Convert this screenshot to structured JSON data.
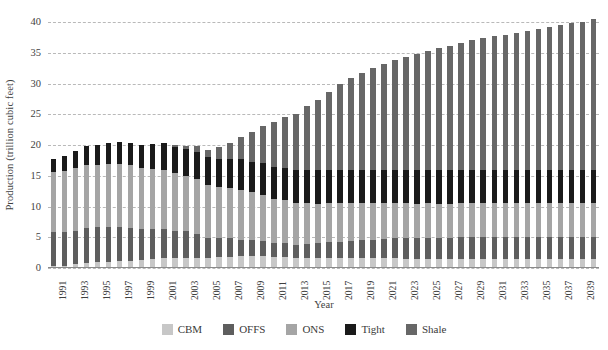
{
  "chart_data": {
    "type": "bar",
    "stacked": true,
    "title": "",
    "xlabel": "Year",
    "ylabel": "Production (trillion cubic feet)",
    "ylim": [
      0,
      40
    ],
    "yticks": [
      0,
      5,
      10,
      15,
      20,
      25,
      30,
      35,
      40
    ],
    "grid": true,
    "legend_position": "bottom",
    "tick_label_interval": 2,
    "categories": [
      "1991",
      "1992",
      "1993",
      "1994",
      "1995",
      "1996",
      "1997",
      "1998",
      "1999",
      "2000",
      "2001",
      "2002",
      "2003",
      "2004",
      "2005",
      "2006",
      "2007",
      "2008",
      "2009",
      "2010",
      "2011",
      "2012",
      "2013",
      "2014",
      "2015",
      "2016",
      "2017",
      "2018",
      "2019",
      "2020",
      "2021",
      "2022",
      "2023",
      "2024",
      "2025",
      "2026",
      "2027",
      "2028",
      "2029",
      "2030",
      "2031",
      "2032",
      "2033",
      "2034",
      "2035",
      "2036",
      "2037",
      "2038",
      "2039",
      "2040"
    ],
    "series": [
      {
        "name": "CBM",
        "color": "#c7c7c7",
        "values": [
          0.3,
          0.4,
          0.6,
          0.8,
          0.9,
          1.0,
          1.1,
          1.2,
          1.3,
          1.4,
          1.6,
          1.6,
          1.7,
          1.7,
          1.7,
          1.8,
          1.8,
          1.9,
          1.9,
          1.9,
          1.8,
          1.8,
          1.7,
          1.7,
          1.6,
          1.6,
          1.6,
          1.6,
          1.6,
          1.6,
          1.6,
          1.6,
          1.5,
          1.5,
          1.5,
          1.5,
          1.5,
          1.5,
          1.5,
          1.5,
          1.5,
          1.5,
          1.5,
          1.5,
          1.5,
          1.5,
          1.5,
          1.5,
          1.5,
          1.5
        ]
      },
      {
        "name": "OFFS",
        "color": "#5e5e5e",
        "values": [
          5.6,
          5.5,
          5.5,
          5.7,
          5.8,
          5.6,
          5.5,
          5.3,
          5.1,
          4.9,
          4.8,
          4.5,
          4.3,
          3.9,
          3.2,
          3.1,
          3.0,
          2.7,
          2.6,
          2.5,
          2.3,
          2.2,
          2.1,
          2.2,
          2.4,
          2.6,
          2.7,
          2.8,
          2.9,
          3.0,
          3.1,
          3.2,
          3.3,
          3.3,
          3.4,
          3.4,
          3.4,
          3.5,
          3.5,
          3.5,
          3.5,
          3.5,
          3.5,
          3.5,
          3.5,
          3.5,
          3.5,
          3.5,
          3.5,
          3.5
        ]
      },
      {
        "name": "ONS",
        "color": "#a5a5a5",
        "values": [
          9.7,
          9.9,
          10.2,
          10.3,
          10.1,
          10.3,
          10.3,
          10.2,
          9.9,
          9.8,
          9.6,
          9.3,
          9.0,
          8.9,
          8.6,
          8.3,
          8.2,
          8.1,
          7.8,
          7.5,
          7.2,
          7.0,
          6.8,
          6.6,
          6.4,
          6.3,
          6.2,
          6.1,
          6.0,
          5.9,
          5.8,
          5.7,
          5.7,
          5.6,
          5.6,
          5.5,
          5.5,
          5.5,
          5.5,
          5.5,
          5.5,
          5.5,
          5.5,
          5.5,
          5.5,
          5.5,
          5.5,
          5.5,
          5.5,
          5.5
        ]
      },
      {
        "name": "Tight",
        "color": "#1a1a1a",
        "values": [
          2.1,
          2.3,
          2.6,
          2.9,
          3.1,
          3.3,
          3.5,
          3.6,
          3.7,
          4.0,
          4.3,
          4.3,
          4.3,
          4.4,
          4.5,
          4.6,
          4.7,
          5.0,
          5.0,
          5.1,
          5.2,
          5.3,
          5.4,
          5.5,
          5.5,
          5.5,
          5.5,
          5.5,
          5.5,
          5.5,
          5.5,
          5.5,
          5.5,
          5.5,
          5.5,
          5.5,
          5.5,
          5.5,
          5.5,
          5.5,
          5.5,
          5.5,
          5.5,
          5.5,
          5.5,
          5.5,
          5.5,
          5.5,
          5.5,
          5.5
        ]
      },
      {
        "name": "Shale",
        "color": "#676767",
        "values": [
          0.0,
          0.0,
          0.0,
          0.0,
          0.0,
          0.0,
          0.0,
          0.0,
          0.0,
          0.0,
          0.0,
          0.3,
          0.5,
          0.8,
          1.2,
          1.8,
          2.6,
          3.6,
          4.8,
          6.0,
          7.2,
          8.2,
          9.0,
          10.2,
          11.3,
          12.6,
          13.9,
          14.9,
          15.7,
          16.4,
          17.1,
          17.8,
          18.3,
          18.8,
          19.3,
          19.8,
          20.2,
          20.6,
          21.0,
          21.3,
          21.6,
          21.9,
          22.2,
          22.5,
          22.8,
          23.1,
          23.4,
          23.7,
          24.0,
          24.4
        ]
      }
    ]
  },
  "legend": {
    "items": [
      {
        "label": "CBM",
        "color": "#c7c7c7"
      },
      {
        "label": "OFFS",
        "color": "#5e5e5e"
      },
      {
        "label": "ONS",
        "color": "#a5a5a5"
      },
      {
        "label": "Tight",
        "color": "#1a1a1a"
      },
      {
        "label": "Shale",
        "color": "#676767"
      }
    ]
  }
}
